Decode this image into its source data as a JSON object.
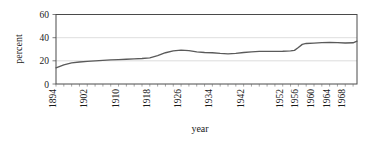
{
  "chart_data": {
    "type": "line",
    "title": "",
    "xlabel": "year",
    "ylabel": "percent",
    "xlim": [
      1894,
      1971
    ],
    "ylim": [
      0,
      60
    ],
    "yticks": [
      0,
      20,
      40,
      60
    ],
    "ytick_labels": [
      "0",
      "20",
      "40",
      "60"
    ],
    "xtick_labels": [
      "1894",
      "1902",
      "1910",
      "1918",
      "1926",
      "1934",
      "1942",
      "1952",
      "1956",
      "1960",
      "1964",
      "1968"
    ],
    "grid": "horizontal",
    "legend": "none",
    "series": [
      {
        "name": "percent",
        "x": [
          1894,
          1896,
          1898,
          1900,
          1902,
          1904,
          1906,
          1908,
          1910,
          1912,
          1914,
          1916,
          1918,
          1920,
          1922,
          1924,
          1926,
          1928,
          1930,
          1932,
          1934,
          1936,
          1938,
          1940,
          1942,
          1944,
          1946,
          1948,
          1950,
          1952,
          1954,
          1955,
          1956,
          1957,
          1958,
          1960,
          1962,
          1964,
          1966,
          1968,
          1970,
          1971
        ],
        "values": [
          14.0,
          16.5,
          18.2,
          19.0,
          19.6,
          20.0,
          20.4,
          20.8,
          21.1,
          21.4,
          21.7,
          22.0,
          22.6,
          24.5,
          27.0,
          28.6,
          29.2,
          28.8,
          27.8,
          27.2,
          27.0,
          26.4,
          26.0,
          26.5,
          27.2,
          27.8,
          28.1,
          28.2,
          28.2,
          28.3,
          28.6,
          29.0,
          31.5,
          34.2,
          35.0,
          35.3,
          35.7,
          36.0,
          35.7,
          35.4,
          35.6,
          37.0
        ]
      }
    ],
    "colors": {
      "line": "#5a5a5a",
      "grid": "#d4d4d4",
      "frame": "#4a4a4a",
      "text": "#1a1a1a",
      "background": "#ffffff"
    }
  },
  "labels": {
    "ylabel": "percent",
    "xlabel": "year",
    "y0": "0",
    "y20": "20",
    "y40": "40",
    "y60": "60",
    "x0": "1894",
    "x1": "1902",
    "x2": "1910",
    "x3": "1918",
    "x4": "1926",
    "x5": "1934",
    "x6": "1942",
    "x7": "1952",
    "x8": "1956",
    "x9": "1960",
    "x10": "1964",
    "x11": "1968"
  }
}
